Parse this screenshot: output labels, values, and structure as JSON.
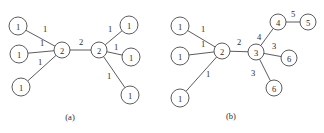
{
  "figure": {
    "width": 324,
    "height": 133,
    "background": "#ffffff",
    "stroke_color": "#4a4a4a",
    "text_color": "#2b2b2b"
  },
  "panels": [
    {
      "id": "panel-a",
      "caption": "(a)",
      "caption_x": 70,
      "caption_y": 117,
      "nodes": [
        {
          "id": "a-n1",
          "label": "1",
          "x": 18,
          "y": 26,
          "r": 9
        },
        {
          "id": "a-n2",
          "label": "1",
          "x": 19,
          "y": 54,
          "r": 9
        },
        {
          "id": "a-n3",
          "label": "1",
          "x": 21,
          "y": 87,
          "r": 9
        },
        {
          "id": "a-n4",
          "label": "2",
          "x": 62,
          "y": 50,
          "r": 8
        },
        {
          "id": "a-n5",
          "label": "2",
          "x": 99,
          "y": 50,
          "r": 8
        },
        {
          "id": "a-n6",
          "label": "1",
          "x": 129,
          "y": 25,
          "r": 9
        },
        {
          "id": "a-n7",
          "label": "1",
          "x": 131,
          "y": 57,
          "r": 9
        },
        {
          "id": "a-n8",
          "label": "1",
          "x": 130,
          "y": 95,
          "r": 9
        }
      ],
      "edges": [
        {
          "id": "a-e1",
          "from": "a-n1",
          "to": "a-n4",
          "label": "1",
          "label_x": 45,
          "label_y": 29
        },
        {
          "id": "a-e2",
          "from": "a-n2",
          "to": "a-n4",
          "label": "1",
          "label_x": 42,
          "label_y": 43
        },
        {
          "id": "a-e3",
          "from": "a-n3",
          "to": "a-n4",
          "label": "1",
          "label_x": 40,
          "label_y": 62
        },
        {
          "id": "a-e4",
          "from": "a-n4",
          "to": "a-n5",
          "label": "2",
          "label_x": 81,
          "label_y": 42
        },
        {
          "id": "a-e5",
          "from": "a-n5",
          "to": "a-n6",
          "label": "1",
          "label_x": 110,
          "label_y": 29
        },
        {
          "id": "a-e6",
          "from": "a-n5",
          "to": "a-n7",
          "label": "1",
          "label_x": 116,
          "label_y": 47
        },
        {
          "id": "a-e7",
          "from": "a-n5",
          "to": "a-n8",
          "label": "1",
          "label_x": 109,
          "label_y": 76
        }
      ]
    },
    {
      "id": "panel-b",
      "caption": "(b)",
      "caption_x": 231,
      "caption_y": 116,
      "nodes": [
        {
          "id": "b-n1",
          "label": "1",
          "x": 180,
          "y": 26,
          "r": 9
        },
        {
          "id": "b-n2",
          "label": "1",
          "x": 180,
          "y": 56,
          "r": 9
        },
        {
          "id": "b-n3",
          "label": "1",
          "x": 180,
          "y": 98,
          "r": 9
        },
        {
          "id": "b-n4",
          "label": "2",
          "x": 222,
          "y": 51,
          "r": 8
        },
        {
          "id": "b-n5",
          "label": "3",
          "x": 256,
          "y": 52,
          "r": 8
        },
        {
          "id": "b-n6",
          "label": "4",
          "x": 278,
          "y": 22,
          "r": 8
        },
        {
          "id": "b-n7",
          "label": "5",
          "x": 308,
          "y": 22,
          "r": 8
        },
        {
          "id": "b-n8",
          "label": "6",
          "x": 289,
          "y": 58,
          "r": 8
        },
        {
          "id": "b-n9",
          "label": "6",
          "x": 274,
          "y": 88,
          "r": 8
        }
      ],
      "edges": [
        {
          "id": "b-e1",
          "from": "b-n1",
          "to": "b-n4",
          "label": "1",
          "label_x": 203,
          "label_y": 29
        },
        {
          "id": "b-e2",
          "from": "b-n2",
          "to": "b-n4",
          "label": "1",
          "label_x": 203,
          "label_y": 44
        },
        {
          "id": "b-e3",
          "from": "b-n3",
          "to": "b-n4",
          "label": "1",
          "label_x": 208,
          "label_y": 74
        },
        {
          "id": "b-e4",
          "from": "b-n4",
          "to": "b-n5",
          "label": "2",
          "label_x": 239,
          "label_y": 42
        },
        {
          "id": "b-e5",
          "from": "b-n5",
          "to": "b-n6",
          "label": "4",
          "label_x": 259,
          "label_y": 37
        },
        {
          "id": "b-e6",
          "from": "b-n6",
          "to": "b-n7",
          "label": "5",
          "label_x": 293,
          "label_y": 14
        },
        {
          "id": "b-e7",
          "from": "b-n5",
          "to": "b-n8",
          "label": "3",
          "label_x": 274,
          "label_y": 46
        },
        {
          "id": "b-e8",
          "from": "b-n5",
          "to": "b-n9",
          "label": "3",
          "label_x": 253,
          "label_y": 73
        }
      ]
    }
  ]
}
